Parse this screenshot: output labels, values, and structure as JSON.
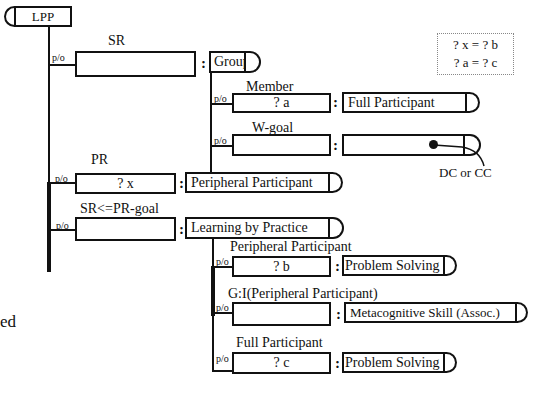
{
  "diagram": {
    "root": {
      "label": "LPP"
    },
    "note": {
      "lines": [
        "? x = ? b",
        "? a = ? c"
      ]
    },
    "part_of_label": "p/o",
    "colon": ":",
    "sr": {
      "role": "SR",
      "value": "",
      "type": "Group",
      "children": [
        {
          "role": "Member",
          "value": "? a",
          "type": "Full Participant"
        },
        {
          "role": "W-goal",
          "value": "",
          "type": "",
          "annotation": "DC or CC"
        }
      ]
    },
    "pr": {
      "role": "PR",
      "value": "? x",
      "type": "Peripheral Participant"
    },
    "goal": {
      "role": "SR<=PR-goal",
      "value": "",
      "type": "Learning by Practice",
      "children": [
        {
          "role": "Peripheral Participant",
          "value": "? b",
          "type": "Problem Solving"
        },
        {
          "role": "G:I(Peripheral Participant)",
          "value": "",
          "type": "Metacognitive Skill (Assoc.)"
        },
        {
          "role": "Full Participant",
          "value": "? c",
          "type": "Problem Solving"
        }
      ]
    },
    "margin_text": "ed"
  }
}
